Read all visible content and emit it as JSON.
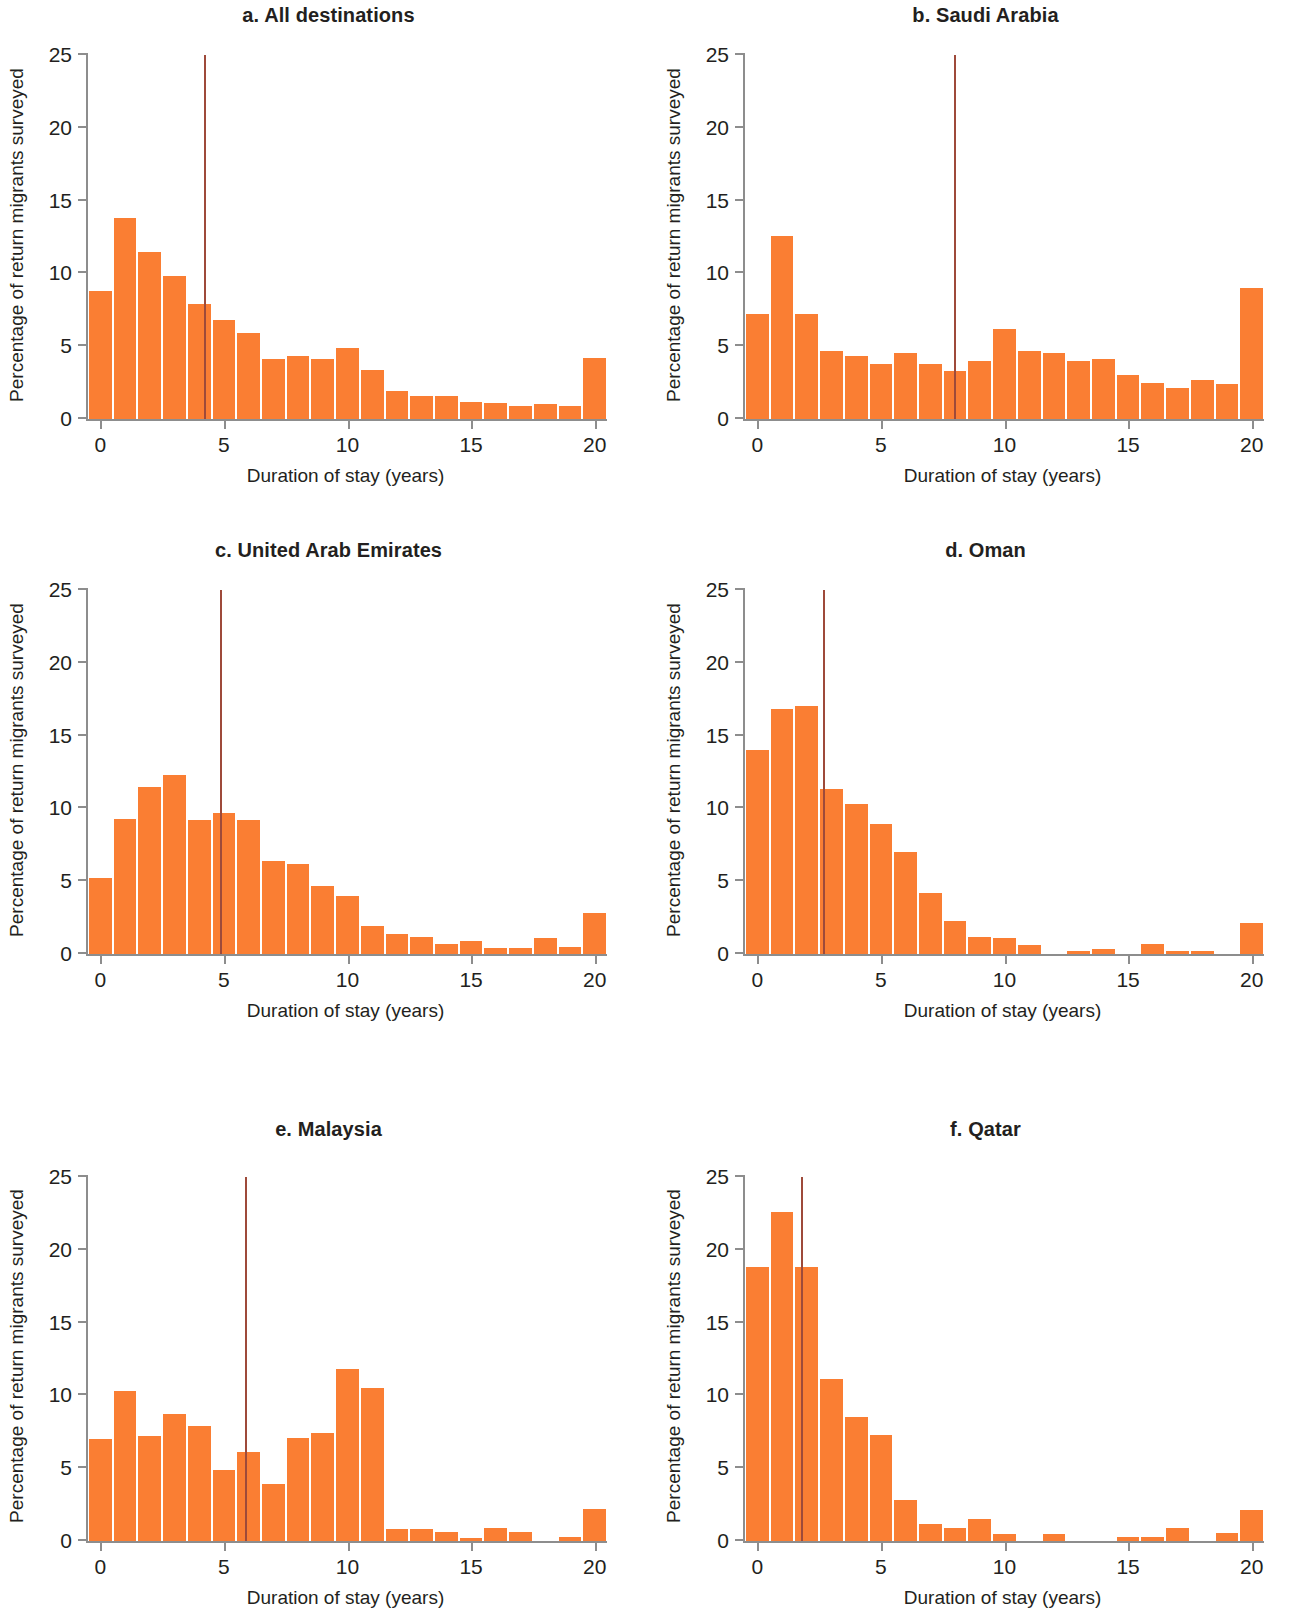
{
  "figure": {
    "axis_labels": {
      "x": "Duration of stay (years)",
      "y": "Percentage of return migrants surveyed"
    },
    "colors": {
      "bar": "#fa7e33",
      "median_line": "#9e4a3a",
      "axis": "#8d8d8d",
      "text": "#231f20"
    }
  },
  "chart_data": [
    {
      "type": "bar",
      "panel": "a",
      "title": "a. All destinations",
      "xlabel": "Duration of stay (years)",
      "ylabel": "Percentage of return migrants surveyed",
      "xlim": [
        -0.5,
        20.5
      ],
      "ylim": [
        0,
        25
      ],
      "xticks": [
        0,
        5,
        10,
        15,
        20
      ],
      "yticks": [
        0,
        5,
        10,
        15,
        20,
        25
      ],
      "grid": false,
      "bin_width": 1,
      "median": 4.25,
      "median_label": "median duration of stay",
      "categories": [
        0,
        1,
        2,
        3,
        4,
        5,
        6,
        7,
        8,
        9,
        10,
        11,
        12,
        13,
        14,
        15,
        16,
        17,
        18,
        19,
        20
      ],
      "values": [
        8.8,
        13.8,
        11.5,
        9.8,
        7.9,
        6.8,
        5.9,
        4.1,
        4.3,
        4.1,
        4.9,
        3.4,
        1.9,
        1.6,
        1.6,
        1.2,
        1.1,
        0.9,
        1.0,
        0.9,
        4.2
      ]
    },
    {
      "type": "bar",
      "panel": "b",
      "title": "b. Saudi Arabia",
      "xlabel": "Duration of stay (years)",
      "ylabel": "Percentage of return migrants surveyed",
      "xlim": [
        -0.5,
        20.5
      ],
      "ylim": [
        0,
        25
      ],
      "xticks": [
        0,
        5,
        10,
        15,
        20
      ],
      "yticks": [
        0,
        5,
        10,
        15,
        20,
        25
      ],
      "grid": false,
      "bin_width": 1,
      "median": 8.0,
      "median_label": "median duration of stay",
      "categories": [
        0,
        1,
        2,
        3,
        4,
        5,
        6,
        7,
        8,
        9,
        10,
        11,
        12,
        13,
        14,
        15,
        16,
        17,
        18,
        19,
        20
      ],
      "values": [
        7.2,
        12.6,
        7.2,
        4.7,
        4.3,
        3.8,
        4.5,
        3.8,
        3.3,
        4.0,
        6.2,
        4.7,
        4.5,
        4.0,
        4.1,
        3.0,
        2.5,
        2.1,
        2.7,
        2.4,
        9.0
      ]
    },
    {
      "type": "bar",
      "panel": "c",
      "title": "c. United Arab Emirates",
      "xlabel": "Duration of stay (years)",
      "ylabel": "Percentage of return migrants surveyed",
      "xlim": [
        -0.5,
        20.5
      ],
      "ylim": [
        0,
        25
      ],
      "xticks": [
        0,
        5,
        10,
        15,
        20
      ],
      "yticks": [
        0,
        5,
        10,
        15,
        20,
        25
      ],
      "grid": false,
      "bin_width": 1,
      "median": 4.9,
      "median_label": "median duration of stay",
      "categories": [
        0,
        1,
        2,
        3,
        4,
        5,
        6,
        7,
        8,
        9,
        10,
        11,
        12,
        13,
        14,
        15,
        16,
        17,
        18,
        19,
        20
      ],
      "values": [
        5.2,
        9.3,
        11.5,
        12.3,
        9.2,
        9.7,
        9.2,
        6.4,
        6.2,
        4.7,
        4.0,
        1.9,
        1.4,
        1.2,
        0.7,
        0.9,
        0.4,
        0.4,
        1.1,
        0.5,
        2.8
      ]
    },
    {
      "type": "bar",
      "panel": "d",
      "title": "d. Oman",
      "xlabel": "Duration of stay (years)",
      "ylabel": "Percentage of return migrants surveyed",
      "xlim": [
        -0.5,
        20.5
      ],
      "ylim": [
        0,
        25
      ],
      "xticks": [
        0,
        5,
        10,
        15,
        20
      ],
      "yticks": [
        0,
        5,
        10,
        15,
        20,
        25
      ],
      "grid": false,
      "bin_width": 1,
      "median": 2.7,
      "median_label": "median duration of stay",
      "categories": [
        0,
        1,
        2,
        3,
        4,
        5,
        6,
        7,
        8,
        9,
        10,
        11,
        12,
        13,
        14,
        15,
        16,
        17,
        18,
        19,
        20
      ],
      "values": [
        14.0,
        16.8,
        17.0,
        11.3,
        10.3,
        8.9,
        7.0,
        4.2,
        2.3,
        1.2,
        1.1,
        0.6,
        0.0,
        0.2,
        0.35,
        0.0,
        0.7,
        0.2,
        0.2,
        0.0,
        2.1
      ]
    },
    {
      "type": "bar",
      "panel": "e",
      "title": "e. Malaysia",
      "xlabel": "Duration of stay (years)",
      "ylabel": "Percentage of return migrants surveyed",
      "xlim": [
        -0.5,
        20.5
      ],
      "ylim": [
        0,
        25
      ],
      "xticks": [
        0,
        5,
        10,
        15,
        20
      ],
      "yticks": [
        0,
        5,
        10,
        15,
        20,
        25
      ],
      "grid": false,
      "bin_width": 1,
      "median": 5.9,
      "median_label": "median duration of stay",
      "categories": [
        0,
        1,
        2,
        3,
        4,
        5,
        6,
        7,
        8,
        9,
        10,
        11,
        12,
        13,
        14,
        15,
        16,
        17,
        18,
        19,
        20
      ],
      "values": [
        7.0,
        10.3,
        7.2,
        8.7,
        7.9,
        4.9,
        6.1,
        3.9,
        7.1,
        7.4,
        11.8,
        10.5,
        0.8,
        0.8,
        0.6,
        0.2,
        0.9,
        0.6,
        0.0,
        0.3,
        2.2
      ]
    },
    {
      "type": "bar",
      "panel": "f",
      "title": "f. Qatar",
      "xlabel": "Duration of stay (years)",
      "ylabel": "Percentage of return migrants surveyed",
      "xlim": [
        -0.5,
        20.5
      ],
      "ylim": [
        0,
        25
      ],
      "xticks": [
        0,
        5,
        10,
        15,
        20
      ],
      "yticks": [
        0,
        5,
        10,
        15,
        20,
        25
      ],
      "grid": false,
      "bin_width": 1,
      "median": 1.8,
      "median_label": "median duration of stay",
      "categories": [
        0,
        1,
        2,
        3,
        4,
        5,
        6,
        7,
        8,
        9,
        10,
        11,
        12,
        13,
        14,
        15,
        16,
        17,
        18,
        19,
        20
      ],
      "values": [
        18.8,
        22.6,
        18.8,
        11.1,
        8.5,
        7.3,
        2.8,
        1.2,
        0.9,
        1.5,
        0.5,
        0.0,
        0.5,
        0.0,
        0.0,
        0.25,
        0.25,
        0.9,
        0.0,
        0.55,
        2.1
      ]
    }
  ]
}
